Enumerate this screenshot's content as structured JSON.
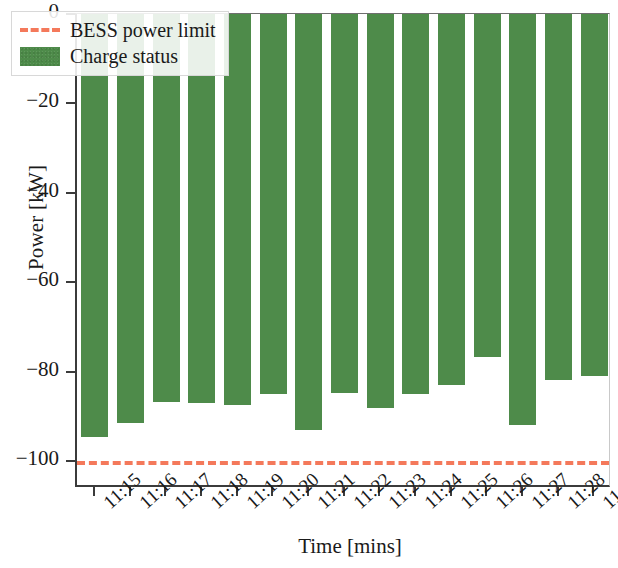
{
  "chart_data": {
    "type": "bar",
    "title": "",
    "xlabel": "Time [mins]",
    "ylabel": "Power [kW]",
    "categories": [
      "11:15",
      "11:16",
      "11:17",
      "11:18",
      "11:19",
      "11:20",
      "11:21",
      "11:22",
      "11:23",
      "11:24",
      "11:25",
      "11:26",
      "11:27",
      "11:28",
      "11:29"
    ],
    "series": [
      {
        "name": "Charge status",
        "color": "#4e8b4a",
        "values": [
          -94.7,
          -91.4,
          -86.8,
          -87.1,
          -87.5,
          -84.9,
          -93.1,
          -84.8,
          -88.2,
          -84.9,
          -83.0,
          -76.6,
          -92.0,
          -81.8,
          -81.0
        ]
      }
    ],
    "reference_lines": [
      {
        "name": "BESS power limit",
        "value": -100,
        "color": "#f4795b",
        "style": "dashed"
      }
    ],
    "ylim": [
      -106,
      0
    ],
    "yticks": [
      0,
      -20,
      -40,
      -60,
      -80,
      -100
    ],
    "ytick_labels": [
      "0",
      "−20",
      "−40",
      "−60",
      "−80",
      "−100"
    ],
    "grid": false,
    "legend_position": "upper left",
    "legend": [
      {
        "label": "BESS power limit",
        "marker": "dashed-line",
        "color": "#f4795b"
      },
      {
        "label": "Charge status",
        "marker": "filled-box",
        "color": "#4e8b4a"
      }
    ]
  }
}
